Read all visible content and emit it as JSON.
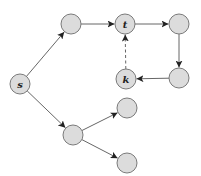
{
  "diagram": {
    "type": "directed-graph",
    "node_radius": 10,
    "colors": {
      "node_fill": "#dcdcdc",
      "node_stroke": "#7a7a7a",
      "edge": "#555555",
      "label": "#222222"
    },
    "nodes": [
      {
        "id": "s",
        "label": "s",
        "x": 20,
        "y": 84
      },
      {
        "id": "a",
        "label": "",
        "x": 71,
        "y": 24
      },
      {
        "id": "t",
        "label": "t",
        "x": 125,
        "y": 24
      },
      {
        "id": "b",
        "label": "",
        "x": 179,
        "y": 24
      },
      {
        "id": "c",
        "label": "",
        "x": 179,
        "y": 78
      },
      {
        "id": "k",
        "label": "k",
        "x": 126,
        "y": 79
      },
      {
        "id": "d",
        "label": "",
        "x": 73,
        "y": 135
      },
      {
        "id": "e",
        "label": "",
        "x": 127,
        "y": 108
      },
      {
        "id": "f",
        "label": "",
        "x": 127,
        "y": 163
      }
    ],
    "edges": [
      {
        "from": "s",
        "to": "a",
        "style": "solid"
      },
      {
        "from": "a",
        "to": "t",
        "style": "solid"
      },
      {
        "from": "t",
        "to": "b",
        "style": "solid"
      },
      {
        "from": "b",
        "to": "c",
        "style": "solid"
      },
      {
        "from": "c",
        "to": "k",
        "style": "solid"
      },
      {
        "from": "k",
        "to": "t",
        "style": "dashed"
      },
      {
        "from": "s",
        "to": "d",
        "style": "solid"
      },
      {
        "from": "d",
        "to": "e",
        "style": "solid"
      },
      {
        "from": "d",
        "to": "f",
        "style": "solid"
      }
    ]
  }
}
